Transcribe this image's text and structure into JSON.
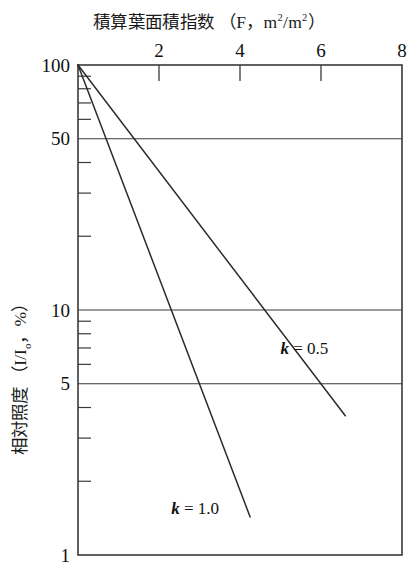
{
  "chart_data": {
    "type": "line",
    "title_parts": {
      "main": "積算葉面積指数",
      "paren_open": "（",
      "symbol": "F",
      "comma": "，",
      "unit_num": "m",
      "unit_num_sup": "2",
      "unit_slash": "/",
      "unit_den": "m",
      "unit_den_sup": "2",
      "paren_close": "）"
    },
    "xlabel": "積算葉面積指数 （F，m2/m2）",
    "ylabel": "相対照度 （I/I。，%）",
    "ylabel_parts": {
      "main": "相対照度",
      "paren_open": "（",
      "i_symbol": "I",
      "slash": "/",
      "i0_symbol": "I",
      "i0_sub": "o",
      "comma": "，",
      "percent": "%",
      "paren_close": "）"
    },
    "xscale": "linear",
    "yscale": "log",
    "xlim": [
      0,
      8
    ],
    "ylim": [
      1,
      100
    ],
    "grid": "horizontal-at-labeled-y",
    "legend": "inline-annotations",
    "x_ticks_major": [
      2,
      4,
      6,
      8
    ],
    "x_tick_labels": [
      "2",
      "4",
      "6",
      "8"
    ],
    "y_ticks_major": [
      100,
      50,
      10,
      5,
      1
    ],
    "y_tick_labels": [
      "100",
      "50",
      "10",
      "5",
      "1"
    ],
    "y_ticks_minor": [
      90,
      80,
      70,
      60,
      40,
      30,
      20,
      9,
      8,
      7,
      6,
      4,
      3,
      2
    ],
    "y_gridlines": [
      50,
      10,
      5
    ],
    "equation": "I/Io = 100 * exp(-k * F)",
    "series": [
      {
        "name": "k = 0.5",
        "k": 0.5,
        "label": "k = 0.5",
        "label_k": "k",
        "label_eq": " = 0.5",
        "annotation_x": 5.0,
        "annotation_y": 7.0,
        "color": "#2b2b2b",
        "x_start": 0.0,
        "y_start": 100.0,
        "x_end": 6.6,
        "y_end": 3.7,
        "points": [
          {
            "F": 0.0,
            "I": 100.0
          },
          {
            "F": 1.0,
            "I": 60.7
          },
          {
            "F": 2.0,
            "I": 36.8
          },
          {
            "F": 3.0,
            "I": 22.3
          },
          {
            "F": 4.0,
            "I": 13.5
          },
          {
            "F": 5.0,
            "I": 8.2
          },
          {
            "F": 6.0,
            "I": 5.0
          },
          {
            "F": 6.6,
            "I": 3.7
          }
        ]
      },
      {
        "name": "k = 1.0",
        "k": 1.0,
        "label": "k = 1.0",
        "label_k": "k",
        "label_eq": " = 1.0",
        "annotation_x": 2.3,
        "annotation_y": 1.55,
        "color": "#2b2b2b",
        "x_start": 0.0,
        "y_start": 100.0,
        "x_end": 4.25,
        "y_end": 1.43,
        "points": [
          {
            "F": 0.0,
            "I": 100.0
          },
          {
            "F": 0.5,
            "I": 60.7
          },
          {
            "F": 1.0,
            "I": 36.8
          },
          {
            "F": 1.5,
            "I": 22.3
          },
          {
            "F": 2.0,
            "I": 13.5
          },
          {
            "F": 2.5,
            "I": 8.2
          },
          {
            "F": 3.0,
            "I": 5.0
          },
          {
            "F": 3.5,
            "I": 3.0
          },
          {
            "F": 4.0,
            "I": 1.8
          },
          {
            "F": 4.25,
            "I": 1.43
          }
        ]
      }
    ]
  }
}
